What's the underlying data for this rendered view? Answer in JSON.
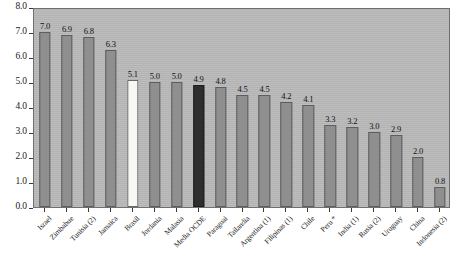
{
  "chart_data": {
    "type": "bar",
    "title": "",
    "subtitle": "",
    "xlabel": "",
    "ylabel": "",
    "ylim": [
      0.0,
      8.0
    ],
    "ytick_labels": [
      "0.0",
      "1.0",
      "2.0",
      "3.0",
      "4.0",
      "5.0",
      "6.0",
      "7.0",
      "8.0"
    ],
    "ytick_values": [
      0.0,
      1.0,
      2.0,
      3.0,
      4.0,
      5.0,
      6.0,
      7.0,
      8.0
    ],
    "grid": false,
    "legend": "none",
    "categories": [
      "Israel",
      "Zimbabue",
      "Tunisia (2)",
      "Jamaica",
      "Brasil",
      "Jordania",
      "Malasia",
      "Media OCDE",
      "Paraguai",
      "Tailandia",
      "Argentina (1)",
      "Filipinas (1)",
      "Chile",
      "Peru *",
      "India (1)",
      "Rusia (2)",
      "Uruguay",
      "China",
      "Indonesia (2)"
    ],
    "values": [
      7.0,
      6.9,
      6.8,
      6.3,
      5.1,
      5.0,
      5.0,
      4.9,
      4.8,
      4.5,
      4.5,
      4.2,
      4.1,
      3.3,
      3.2,
      3.0,
      2.9,
      2.0,
      0.8
    ],
    "value_labels": [
      "7.0",
      "6.9",
      "6.8",
      "6.3",
      "5.1",
      "5.0",
      "5.0",
      "4.9",
      "4.8",
      "4.5",
      "4.5",
      "4.2",
      "4.1",
      "3.3",
      "3.2",
      "3.0",
      "2.9",
      "2.0",
      "0.8"
    ],
    "bar_styles": [
      "normal",
      "normal",
      "normal",
      "normal",
      "light",
      "normal",
      "normal",
      "dark",
      "normal",
      "normal",
      "normal",
      "normal",
      "normal",
      "normal",
      "normal",
      "normal",
      "normal",
      "normal",
      "normal"
    ],
    "colors": {
      "bar_normal": "#8f8f8f",
      "bar_light": "#f7f7f4",
      "bar_dark": "#2e2e2e",
      "bar_edge": "#5d5d5d",
      "plot_background": "#b9b9b9",
      "plot_border": "#6f6f6f",
      "text": "#1a1a1a",
      "page_background": "#ffffff"
    }
  }
}
